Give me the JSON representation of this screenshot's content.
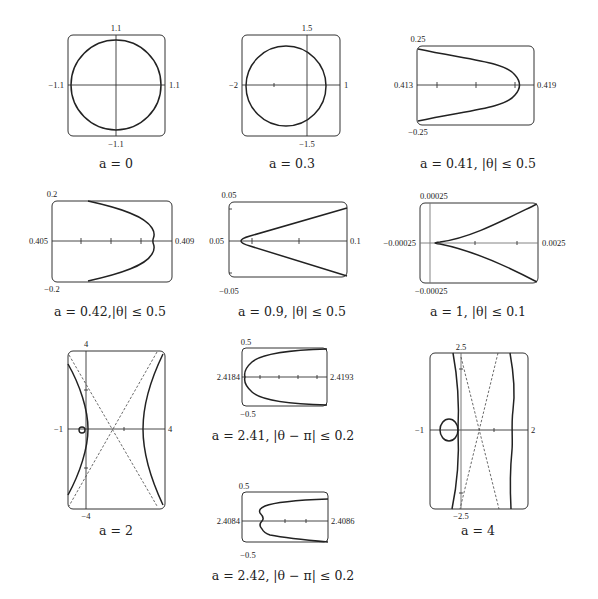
{
  "figure": {
    "panels": [
      {
        "id": "p1",
        "caption": "a = 0",
        "ticks": {
          "top": "1.1",
          "bottom": "−1.1",
          "left": "−1.1",
          "right": "1.1"
        }
      },
      {
        "id": "p2",
        "caption": "a = 0.3",
        "ticks": {
          "top": "1.5",
          "bottom": "−1.5",
          "left": "−2",
          "right": "1"
        }
      },
      {
        "id": "p3",
        "caption": "a = 0.41, |θ| ≤ 0.5",
        "ticks": {
          "top": "0.25",
          "bottom": "−0.25",
          "left": "0.413",
          "right": "0.419"
        }
      },
      {
        "id": "p4",
        "caption": "a = 0.42,|θ| ≤ 0.5",
        "ticks": {
          "top": "0.2",
          "bottom": "−0.2",
          "left": "0.405",
          "right": "0.409"
        }
      },
      {
        "id": "p5",
        "caption": "a = 0.9, |θ| ≤ 0.5",
        "ticks": {
          "top": "0.05",
          "bottom": "−0.05",
          "left": "0.05",
          "right": "0.1"
        }
      },
      {
        "id": "p6",
        "caption": "a = 1, |θ| ≤ 0.1",
        "ticks": {
          "top": "0.00025",
          "bottom": "−0.00025",
          "left": "−0.00025",
          "right": "0.0025"
        }
      },
      {
        "id": "p7",
        "caption": "a = 2",
        "ticks": {
          "top": "4",
          "bottom": "−4",
          "left": "−1",
          "right": "4"
        }
      },
      {
        "id": "p8",
        "caption": "a = 2.41, |θ − π| ≤ 0.2",
        "ticks": {
          "top": "0.5",
          "bottom": "−0.5",
          "left": "2.4184",
          "right": "2.4193"
        }
      },
      {
        "id": "p9",
        "caption": "a = 2.42, |θ − π| ≤ 0.2",
        "ticks": {
          "top": "0.5",
          "bottom": "−0.5",
          "left": "2.4084",
          "right": "2.4086"
        }
      },
      {
        "id": "p10",
        "caption": "a = 4",
        "ticks": {
          "top": "2.5",
          "bottom": "−2.5",
          "left": "−1",
          "right": "2"
        }
      }
    ]
  }
}
